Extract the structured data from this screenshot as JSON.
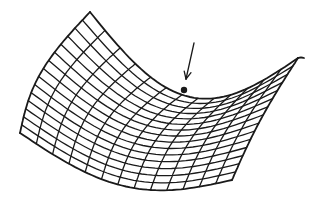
{
  "figure": {
    "description": "Wireframe saddle surface with an arrow pointing to the saddle point",
    "colors": {
      "ink": "#1a1a1a",
      "background": "#ffffff"
    },
    "grid": {
      "u_lines": 15,
      "v_lines": 13
    },
    "corners": {
      "back_left": [
        90,
        12
      ],
      "front_left": [
        20,
        133
      ],
      "front_right": [
        232,
        180
      ],
      "back_right": [
        298,
        58
      ]
    },
    "saddle_point": {
      "x": 184,
      "y": 90,
      "radius": 3.2
    },
    "arrow": {
      "tail": [
        194,
        43
      ],
      "tip": [
        186,
        79
      ]
    }
  }
}
